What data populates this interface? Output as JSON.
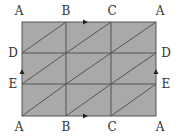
{
  "diagram": {
    "type": "torus-triangulation",
    "colors": {
      "fill": "#a9a9a9",
      "line": "#555555",
      "label": "#333333",
      "background": "#ffffff"
    },
    "grid": {
      "x": [
        22,
        66,
        111,
        156
      ],
      "y": [
        22,
        53,
        84,
        116
      ]
    },
    "labels": {
      "top": [
        "A",
        "B",
        "C",
        "A"
      ],
      "bottom": [
        "A",
        "B",
        "C",
        "A"
      ],
      "left": [
        "D",
        "E"
      ],
      "right": [
        "D",
        "E"
      ]
    },
    "arrows": {
      "top": "right",
      "bottom": "right",
      "left": "up",
      "right": "up"
    }
  }
}
